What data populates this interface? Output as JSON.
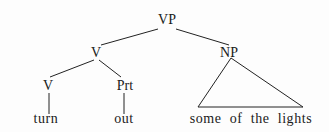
{
  "diagram": {
    "type": "syntax-tree",
    "nodes": {
      "root": "VP",
      "verb_phrase_head": "V",
      "noun_phrase": "NP",
      "verb": "V",
      "particle": "Prt"
    },
    "leaves": {
      "verb_word": "turn",
      "particle_word": "out",
      "np_words": "some of the lights"
    },
    "edges": [
      [
        "VP",
        "V"
      ],
      [
        "VP",
        "NP"
      ],
      [
        "V",
        "V"
      ],
      [
        "V",
        "Prt"
      ],
      [
        "V",
        "turn"
      ],
      [
        "Prt",
        "out"
      ],
      [
        "NP",
        "some of the lights (triangle)"
      ]
    ]
  }
}
